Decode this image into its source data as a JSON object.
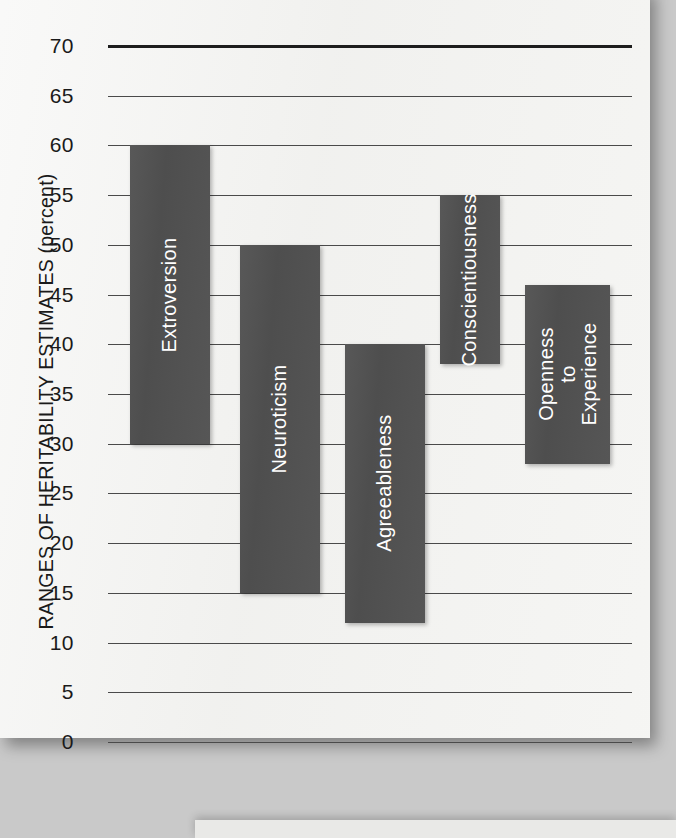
{
  "chart_data": {
    "type": "bar",
    "orientation": "vertical",
    "style": "range-bars",
    "title": "",
    "xlabel": "",
    "ylabel": "RANGES OF HERITABILITY ESTIMATES (percent)",
    "ylim": [
      0,
      70
    ],
    "ytick_step": 5,
    "ytick_labels": [
      "70",
      "65",
      "60",
      "55",
      "50",
      "45",
      "40",
      "35",
      "30",
      "25",
      "20",
      "15",
      "10",
      "5",
      "0"
    ],
    "ytick_values": [
      70,
      65,
      60,
      55,
      50,
      45,
      40,
      35,
      30,
      25,
      20,
      15,
      10,
      5,
      0
    ],
    "grid": true,
    "legend": "none",
    "categories": [
      "Extroversion",
      "Neuroticism",
      "Agreeableness",
      "Conscientiousness",
      "Openness\nto Experience"
    ],
    "series": [
      {
        "name": "Heritability estimate range (percent)",
        "ranges": [
          {
            "category": "Extroversion",
            "low": 30,
            "high": 60
          },
          {
            "category": "Neuroticism",
            "low": 15,
            "high": 50
          },
          {
            "category": "Agreeableness",
            "low": 12,
            "high": 40
          },
          {
            "category": "Conscientiousness",
            "low": 38,
            "high": 55
          },
          {
            "category": "Openness to Experience",
            "low": 28,
            "high": 46
          }
        ]
      }
    ],
    "colors": {
      "bar_fill": "#525252",
      "bar_label_text": "#ffffff",
      "gridline": "#4a4a4a",
      "axis_top_rule": "#1d1d1d",
      "page_background": "#f2f2f0",
      "outer_background": "#c9c9c9",
      "tick_label_text": "#1a1a1a"
    }
  },
  "axis": {
    "ticks": [
      {
        "label": "70",
        "value": 70
      },
      {
        "label": "65",
        "value": 65
      },
      {
        "label": "60",
        "value": 60
      },
      {
        "label": "55",
        "value": 55
      },
      {
        "label": "50",
        "value": 50
      },
      {
        "label": "45",
        "value": 45
      },
      {
        "label": "40",
        "value": 40
      },
      {
        "label": "35",
        "value": 35
      },
      {
        "label": "30",
        "value": 30
      },
      {
        "label": "25",
        "value": 25
      },
      {
        "label": "20",
        "value": 20
      },
      {
        "label": "15",
        "value": 15
      },
      {
        "label": "10",
        "value": 10
      },
      {
        "label": "5",
        "value": 5
      },
      {
        "label": "0",
        "value": 0
      }
    ],
    "y_axis_title": "RANGES OF HERITABILITY ESTIMATES (percent)"
  },
  "bars": [
    {
      "label": "Extroversion",
      "low": 30,
      "high": 60,
      "x": 130,
      "width": 80
    },
    {
      "label": "Neuroticism",
      "low": 15,
      "high": 50,
      "x": 240,
      "width": 80
    },
    {
      "label": "Agreeableness",
      "low": 12,
      "high": 40,
      "x": 345,
      "width": 80
    },
    {
      "label": "Conscientiousness",
      "low": 38,
      "high": 55,
      "x": 440,
      "width": 60
    },
    {
      "label": "Openness\nto Experience",
      "low": 28,
      "high": 46,
      "x": 525,
      "width": 85
    }
  ]
}
